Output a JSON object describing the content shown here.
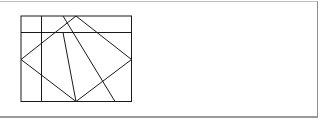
{
  "figure": {
    "stroke_color": "#1a1a1a",
    "frame_color": "#9a9a9a",
    "rectangle": {
      "x1": 21,
      "y1": 16,
      "x2": 131.5,
      "y2": 101.5
    },
    "segments": [
      {
        "name": "top-strip-line",
        "x1": 21,
        "y1": 32.5,
        "x2": 131.5,
        "y2": 32.5
      },
      {
        "name": "left-vertical-line",
        "x1": 41.5,
        "y1": 16,
        "x2": 41.5,
        "y2": 101.5
      },
      {
        "name": "rhombus-top-left",
        "x1": 76,
        "y1": 16,
        "x2": 21,
        "y2": 59.5
      },
      {
        "name": "rhombus-top-right",
        "x1": 76,
        "y1": 16,
        "x2": 131.5,
        "y2": 59.5
      },
      {
        "name": "rhombus-bottom-left",
        "x1": 21,
        "y1": 59.5,
        "x2": 76,
        "y2": 101.5
      },
      {
        "name": "rhombus-bottom-right",
        "x1": 131.5,
        "y1": 59.5,
        "x2": 76,
        "y2": 101.5
      },
      {
        "name": "inner-line-to-bottom-vertex",
        "x1": 63,
        "y1": 32.5,
        "x2": 76,
        "y2": 101.5
      },
      {
        "name": "long-diagonal",
        "x1": 63,
        "y1": 16,
        "x2": 115,
        "y2": 101.5
      }
    ]
  }
}
